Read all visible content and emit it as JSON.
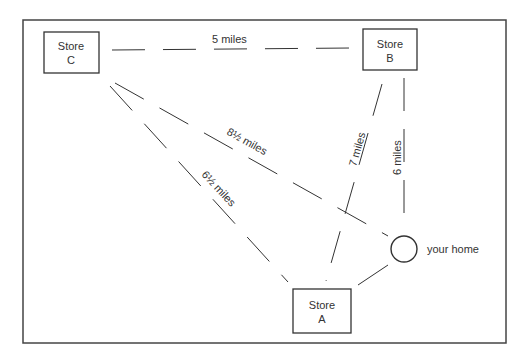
{
  "diagram": {
    "nodes": {
      "store_c": {
        "line1": "Store",
        "line2": "C"
      },
      "store_b": {
        "line1": "Store",
        "line2": "B"
      },
      "store_a": {
        "line1": "Store",
        "line2": "A"
      },
      "home": {
        "label": "your home"
      }
    },
    "edges": {
      "c_b": "5 miles",
      "c_home": "8½ miles",
      "c_a": "6½ miles",
      "b_a": "7 miles",
      "b_home": "6 miles"
    },
    "colors": {
      "line": "#333333",
      "background": "#ffffff"
    }
  }
}
